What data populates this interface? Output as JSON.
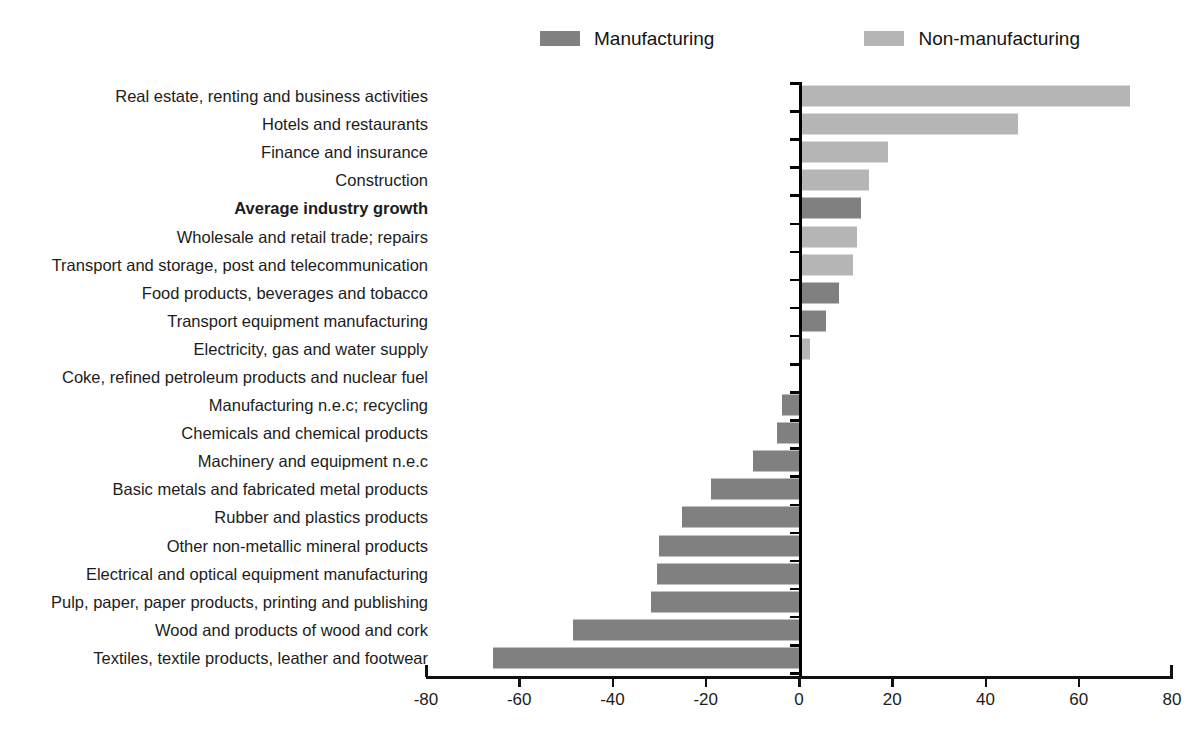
{
  "legend": {
    "position": "top-center",
    "entries": [
      {
        "label": "Manufacturing",
        "color": "#808080",
        "icon": "legend-swatch"
      },
      {
        "label": "Non-manufacturing",
        "color": "#b5b5b5",
        "icon": "legend-swatch"
      }
    ]
  },
  "axis": {
    "ticks": [
      "-80",
      "-60",
      "-40",
      "-20",
      "0",
      "20",
      "40",
      "60",
      "80"
    ],
    "tick_values": [
      -80,
      -60,
      -40,
      -20,
      0,
      20,
      40,
      60,
      80
    ],
    "min": -80,
    "max": 80,
    "step": 20
  },
  "chart_data": {
    "type": "bar",
    "orientation": "horizontal",
    "title": "",
    "subtitle": "",
    "xlabel": "",
    "ylabel": "",
    "xlim": [
      -80,
      80
    ],
    "xticks": [
      -80,
      -60,
      -40,
      -20,
      0,
      20,
      40,
      60,
      80
    ],
    "grid": false,
    "legend_position": "top-center",
    "legend": [
      "Manufacturing",
      "Non-manufacturing"
    ],
    "colors": {
      "Manufacturing": "#808080",
      "Non-manufacturing": "#b5b5b5"
    },
    "categories": [
      "Real estate, renting and business activities",
      "Hotels and restaurants",
      "Finance and insurance",
      "Construction",
      "Average industry growth",
      "Wholesale and retail trade; repairs",
      "Transport and storage, post and telecommunication",
      "Food products, beverages and tobacco",
      "Transport equipment manufacturing",
      "Electricity, gas and water supply",
      "Coke, refined petroleum products and nuclear fuel",
      "Manufacturing n.e.c; recycling",
      "Chemicals and chemical products",
      "Machinery and equipment n.e.c",
      "Basic metals and fabricated metal products",
      "Rubber and plastics products",
      "Other non-metallic mineral products",
      "Electrical and optical equipment manufacturing",
      "Pulp, paper, paper products, printing and publishing",
      "Wood and products of wood and cork",
      "Textiles, textile products, leather and footwear"
    ],
    "values": [
      70.5,
      46.6,
      18.7,
      14.6,
      12.9,
      12.0,
      11.2,
      8.2,
      5.4,
      2.0,
      0.0,
      -3.7,
      -4.7,
      -9.9,
      -18.8,
      -25.2,
      -30.1,
      -30.5,
      -31.8,
      -48.4,
      -65.6
    ],
    "series_of": [
      "Non-manufacturing",
      "Non-manufacturing",
      "Non-manufacturing",
      "Non-manufacturing",
      "Manufacturing",
      "Non-manufacturing",
      "Non-manufacturing",
      "Manufacturing",
      "Manufacturing",
      "Non-manufacturing",
      "Manufacturing",
      "Manufacturing",
      "Manufacturing",
      "Manufacturing",
      "Manufacturing",
      "Manufacturing",
      "Manufacturing",
      "Manufacturing",
      "Manufacturing",
      "Manufacturing",
      "Manufacturing"
    ],
    "emphasis": [
      "Average industry growth"
    ]
  }
}
